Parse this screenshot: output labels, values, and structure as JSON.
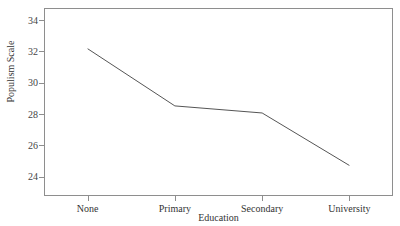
{
  "top_sliver_text": "",
  "chart_data": {
    "type": "line",
    "title": "",
    "xlabel": "Education",
    "ylabel": "Populism Scale",
    "categories": [
      "None",
      "Primary",
      "Secondary",
      "University"
    ],
    "values": [
      32.2,
      28.55,
      28.1,
      24.75
    ],
    "series": [
      {
        "name": "Populism Scale",
        "values": [
          32.2,
          28.55,
          28.1,
          24.75
        ]
      }
    ],
    "ylim": [
      22.8,
      34.8
    ],
    "yticks": [
      24,
      26,
      28,
      30,
      32,
      34
    ],
    "ytick_labels": [
      "24",
      "26",
      "28",
      "30",
      "32",
      "34"
    ],
    "xtick_labels": [
      "None",
      "Primary",
      "Secondary",
      "University"
    ],
    "grid": false,
    "legend": "none",
    "line_color": "#555555",
    "frame_color": "#8e8e8e",
    "background_color": "#ffffff",
    "markers": false
  }
}
